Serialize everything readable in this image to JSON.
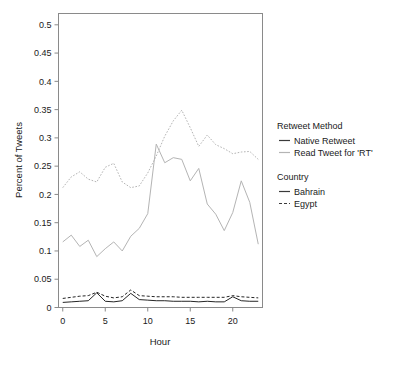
{
  "chart_data": {
    "type": "line",
    "title": "",
    "xlabel": "Hour",
    "ylabel": "Percent of Tweets",
    "xlim": [
      -0.5,
      23.5
    ],
    "ylim": [
      0,
      0.52
    ],
    "xticks": [
      0,
      5,
      10,
      15,
      20
    ],
    "xtick_labels": [
      "0",
      "5",
      "10",
      "15",
      "20"
    ],
    "yticks": [
      0,
      0.05,
      0.1,
      0.15,
      0.2,
      0.25,
      0.3,
      0.35,
      0.4,
      0.45,
      0.5
    ],
    "ytick_labels": [
      "0",
      "0.05",
      "0.1",
      "0.15",
      "0.2",
      "0.25",
      "0.3",
      "0.35",
      "0.4",
      "0.45",
      "0.5"
    ],
    "grid": false,
    "legend_position": "right",
    "x": [
      0,
      1,
      2,
      3,
      4,
      5,
      6,
      7,
      8,
      9,
      10,
      11,
      12,
      13,
      14,
      15,
      16,
      17,
      18,
      19,
      20,
      21,
      22,
      23
    ],
    "series": [
      {
        "name": "Read Tweet for 'RT' - Egypt",
        "country": "Egypt",
        "method": "Read Tweet for 'RT'",
        "color": "#b4b4b4",
        "dash": "dotted",
        "values": [
          0.212,
          0.231,
          0.24,
          0.227,
          0.222,
          0.248,
          0.255,
          0.222,
          0.212,
          0.215,
          0.238,
          0.268,
          0.303,
          0.33,
          0.349,
          0.318,
          0.285,
          0.305,
          0.288,
          0.281,
          0.272,
          0.275,
          0.276,
          0.262
        ]
      },
      {
        "name": "Native Retweet - Bahrain",
        "country": "Bahrain",
        "method": "Native Retweet",
        "color": "#b4b4b4",
        "dash": "solid",
        "values": [
          0.116,
          0.128,
          0.108,
          0.119,
          0.09,
          0.104,
          0.116,
          0.1,
          0.126,
          0.14,
          0.166,
          0.289,
          0.256,
          0.265,
          0.262,
          0.224,
          0.246,
          0.183,
          0.165,
          0.136,
          0.168,
          0.224,
          0.186,
          0.112
        ]
      },
      {
        "name": "Native Retweet - Bahrain (low)",
        "country": "Bahrain",
        "method": "Native Retweet",
        "color": "#262626",
        "dash": "solid",
        "values": [
          0.009,
          0.01,
          0.011,
          0.012,
          0.026,
          0.011,
          0.01,
          0.012,
          0.025,
          0.014,
          0.013,
          0.012,
          0.012,
          0.011,
          0.011,
          0.011,
          0.01,
          0.011,
          0.01,
          0.01,
          0.019,
          0.012,
          0.011,
          0.011
        ]
      },
      {
        "name": "Egypt (low)",
        "country": "Egypt",
        "method": "Native Retweet",
        "color": "#262626",
        "dash": "dashed",
        "values": [
          0.016,
          0.018,
          0.02,
          0.021,
          0.027,
          0.02,
          0.017,
          0.019,
          0.031,
          0.021,
          0.02,
          0.019,
          0.019,
          0.019,
          0.018,
          0.018,
          0.018,
          0.018,
          0.018,
          0.018,
          0.021,
          0.019,
          0.018,
          0.017
        ]
      }
    ]
  },
  "legend": {
    "group1_title": "Retweet Method",
    "group1_items": [
      {
        "label": "Native Retweet",
        "color": "#3a3a3a",
        "dash": "solid"
      },
      {
        "label": "Read Tweet for 'RT'",
        "color": "#b4b4b4",
        "dash": "solid"
      }
    ],
    "group2_title": "Country",
    "group2_items": [
      {
        "label": "Bahrain",
        "color": "#3a3a3a",
        "dash": "solid"
      },
      {
        "label": "Egypt",
        "color": "#3a3a3a",
        "dash": "dashed"
      }
    ]
  }
}
